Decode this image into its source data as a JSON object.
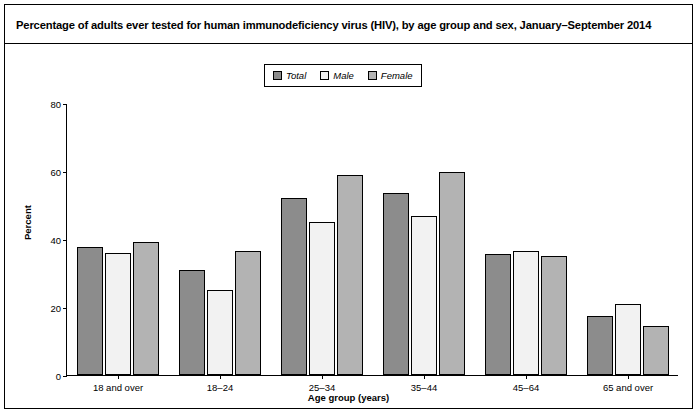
{
  "figure": {
    "title": "Percentage of adults ever tested for human immunodeficiency virus (HIV), by age group and sex, January–September 2014"
  },
  "legend": {
    "items": [
      {
        "label": "Total",
        "color": "#8c8c8c"
      },
      {
        "label": "Male",
        "color": "#f2f2f2"
      },
      {
        "label": "Female",
        "color": "#b3b3b3"
      }
    ]
  },
  "axes": {
    "y_ticks": [
      "0",
      "20",
      "40",
      "60",
      "80"
    ],
    "y_label": "Percent",
    "x_label": "Age group (years)"
  },
  "chart_data": {
    "type": "bar",
    "title": "Percentage of adults ever tested for human immunodeficiency virus (HIV), by age group and sex, January–September 2014",
    "categories": [
      "18 and over",
      "18–24",
      "25–34",
      "35–44",
      "45–64",
      "65 and over"
    ],
    "series": [
      {
        "name": "Total",
        "color": "#8c8c8c",
        "values": [
          37.6,
          30.9,
          52.2,
          53.6,
          35.6,
          17.4
        ]
      },
      {
        "name": "Male",
        "color": "#f2f2f2",
        "values": [
          35.9,
          24.9,
          45.1,
          46.8,
          36.6,
          21.0
        ]
      },
      {
        "name": "Female",
        "color": "#b3b3b3",
        "values": [
          39.2,
          36.5,
          58.7,
          59.6,
          34.9,
          14.5
        ]
      }
    ],
    "xlabel": "Age group (years)",
    "ylabel": "Percent",
    "ylim": [
      0,
      80
    ],
    "yticks": [
      0,
      20,
      40,
      60,
      80
    ],
    "grid": false,
    "legend_position": "top-center"
  }
}
